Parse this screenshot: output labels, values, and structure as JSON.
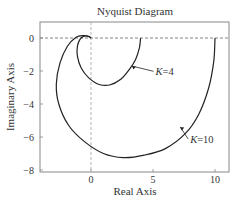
{
  "chart_data": {
    "type": "line",
    "title": "Nyquist Diagram",
    "xlabel": "Real Axis",
    "ylabel": "Imaginary Axis",
    "xlim": [
      -4,
      11
    ],
    "ylim": [
      -8,
      1
    ],
    "xticks": [
      0,
      5,
      10
    ],
    "yticks": [
      0,
      -2,
      -4,
      -6,
      -8
    ],
    "grid": false,
    "reference_lines": [
      {
        "type": "horizontal",
        "value": 0,
        "style": "dashed"
      },
      {
        "type": "vertical",
        "value": 0,
        "style": "dashed"
      }
    ],
    "series": [
      {
        "name": "K=4",
        "label": "K=4",
        "points": [
          [
            4.0,
            0.0
          ],
          [
            3.9,
            -0.6
          ],
          [
            3.6,
            -1.3
          ],
          [
            3.1,
            -1.9
          ],
          [
            2.4,
            -2.5
          ],
          [
            1.5,
            -2.85
          ],
          [
            0.6,
            -2.8
          ],
          [
            -0.2,
            -2.4
          ],
          [
            -0.8,
            -1.8
          ],
          [
            -1.1,
            -1.1
          ],
          [
            -1.1,
            -0.5
          ],
          [
            -0.9,
            -0.1
          ],
          [
            -0.6,
            0.1
          ],
          [
            -0.2,
            0.1
          ],
          [
            0.0,
            0.0
          ]
        ],
        "annotation": {
          "text": "K=4",
          "x": 5.2,
          "y": -2.2,
          "arrow_to": [
            3.3,
            -1.7
          ]
        }
      },
      {
        "name": "K=10",
        "label": "K=10",
        "points": [
          [
            10.0,
            0.0
          ],
          [
            9.9,
            -1.4
          ],
          [
            9.5,
            -3.0
          ],
          [
            8.7,
            -4.6
          ],
          [
            7.6,
            -5.8
          ],
          [
            6.0,
            -6.7
          ],
          [
            4.3,
            -7.1
          ],
          [
            2.6,
            -7.25
          ],
          [
            1.0,
            -7.0
          ],
          [
            -0.5,
            -6.3
          ],
          [
            -1.8,
            -5.3
          ],
          [
            -2.6,
            -4.0
          ],
          [
            -2.8,
            -2.8
          ],
          [
            -2.5,
            -1.5
          ],
          [
            -1.9,
            -0.5
          ],
          [
            -1.2,
            0.05
          ],
          [
            -0.6,
            0.15
          ],
          [
            -0.2,
            0.1
          ],
          [
            0.0,
            0.0
          ]
        ],
        "annotation": {
          "text": "K=10",
          "x": 8.0,
          "y": -6.3,
          "arrow_to": [
            7.2,
            -5.4
          ]
        }
      }
    ]
  }
}
